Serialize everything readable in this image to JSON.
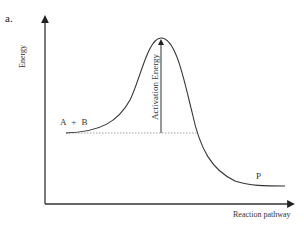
{
  "figure": {
    "panel_label": "a.",
    "y_axis_label": "Energy",
    "x_axis_label": "Reaction pathway",
    "reactants_label": "A + B",
    "product_label": "P",
    "activation_energy_label": "Activation Energy"
  },
  "diagram_data": {
    "type": "energy-profile",
    "curve_points": [
      [
        66,
        133
      ],
      [
        100,
        128
      ],
      [
        125,
        105
      ],
      [
        143,
        60
      ],
      [
        161,
        38
      ],
      [
        178,
        60
      ],
      [
        195,
        125
      ],
      [
        215,
        168
      ],
      [
        240,
        183
      ],
      [
        285,
        186
      ]
    ],
    "reactant_level_y": 133,
    "transition_state": {
      "x": 161,
      "y": 38
    },
    "product_level_y": 186,
    "axes": {
      "origin": [
        45,
        204
      ],
      "y_top": 17,
      "x_right": 293
    },
    "colors": {
      "line": "#333333",
      "dotted": "#888888",
      "background": "#ffffff"
    }
  }
}
